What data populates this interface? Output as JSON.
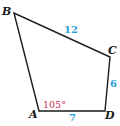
{
  "figure": {
    "vertices": [
      {
        "name": "A",
        "x": 39,
        "y": 111,
        "label_x": 29,
        "label_y": 118
      },
      {
        "name": "B",
        "x": 14,
        "y": 13,
        "label_x": 2,
        "label_y": 15
      },
      {
        "name": "C",
        "x": 110,
        "y": 57,
        "label_x": 108,
        "label_y": 54
      },
      {
        "name": "D",
        "x": 105,
        "y": 111,
        "label_x": 105,
        "label_y": 119
      }
    ],
    "sides": [
      {
        "from": "B",
        "to": "C",
        "length": "12",
        "label_x": 64,
        "label_y": 33
      },
      {
        "from": "C",
        "to": "D",
        "length": "6",
        "label_x": 110,
        "label_y": 87
      },
      {
        "from": "A",
        "to": "D",
        "length": "7",
        "label_x": 69,
        "label_y": 121
      },
      {
        "from": "A",
        "to": "B",
        "length": ""
      }
    ],
    "angles": [
      {
        "vertex": "A",
        "value": "105°",
        "label_x": 43,
        "label_y": 108
      }
    ],
    "colors": {
      "line": "#1a1a1a",
      "side_label": "#2a9fd6",
      "angle_label": "#c8305a"
    }
  }
}
